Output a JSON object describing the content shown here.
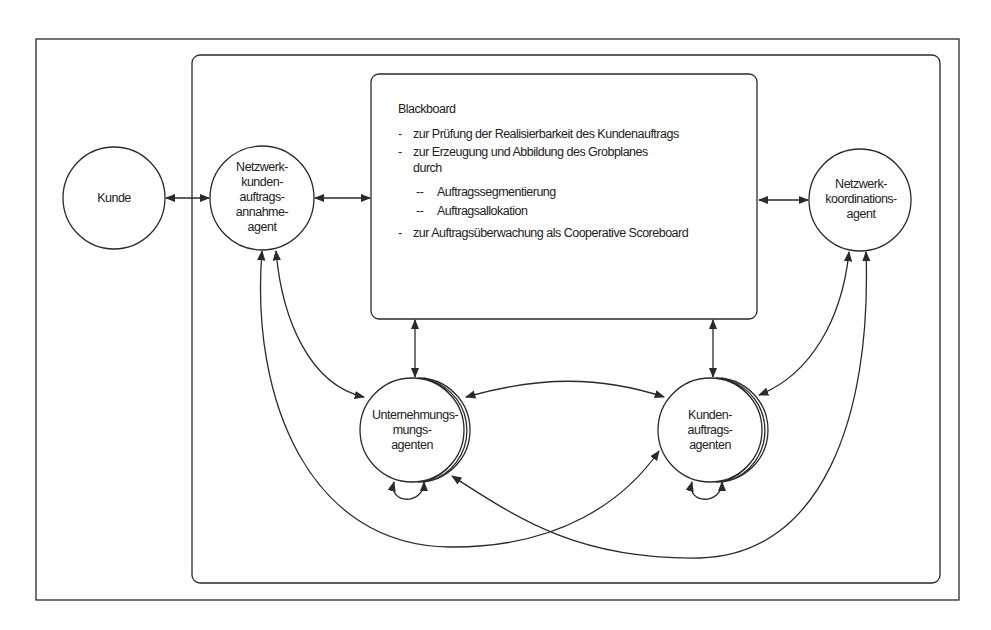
{
  "diagram": {
    "nodes": {
      "kunde": {
        "label": "Kunde"
      },
      "annahme_agent": {
        "lines": [
          "Netzwerk-",
          "kunden-",
          "auftrags-",
          "annahme-",
          "agent"
        ]
      },
      "koordinations_agent": {
        "lines": [
          "Netzwerk-",
          "koordinations-",
          "agent"
        ]
      },
      "unternehmungs_agenten": {
        "lines": [
          "Unternehmungs-",
          "mungs-",
          "agenten"
        ]
      },
      "kundenauftrags_agenten": {
        "lines": [
          "Kunden-",
          "auftrags-",
          "agenten"
        ]
      }
    },
    "blackboard": {
      "title": "Blackboard",
      "items": [
        {
          "marker": "-",
          "text": "zur Prüfung der Realisierbarkeit des Kundenauftrags"
        },
        {
          "marker": "-",
          "text": "zur Erzeugung und Abbildung des Grobplanes"
        },
        {
          "marker": "",
          "text": "durch"
        },
        {
          "marker": "--",
          "text": "Auftragssegmentierung"
        },
        {
          "marker": "--",
          "text": "Auftragsallokation"
        },
        {
          "marker": "-",
          "text": "zur Auftragsüberwachung als Cooperative Scoreboard"
        }
      ]
    },
    "colors": {
      "stroke": "#2a2a2a",
      "background": "#ffffff"
    }
  }
}
